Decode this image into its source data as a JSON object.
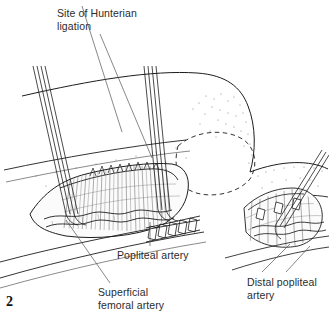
{
  "figure": {
    "number": "2"
  },
  "labels": {
    "hunterian": "Site of Hunterian\nligation",
    "popliteal": "Popliteal artery",
    "superficial_femoral": "Superficial\nfemoral artery",
    "distal_popliteal": "Distal popliteal\nartery"
  },
  "colors": {
    "ink": "#1d1d1d",
    "text": "#2b2b2b",
    "leader": "#555555",
    "background": "#ffffff",
    "tissue": "#fbfbfb"
  },
  "icons": {
    "leg": "leg-outline-icon",
    "knee": "knee-dashed-outline-icon",
    "retractor": "rake-retractor-icon",
    "artery": "artery-vessel-icon",
    "wound": "surgical-wound-icon"
  }
}
